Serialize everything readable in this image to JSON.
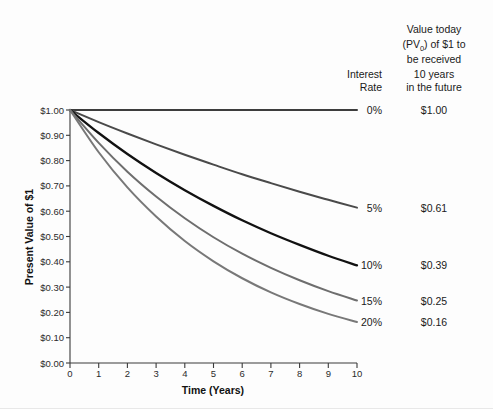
{
  "chart_data": {
    "type": "line",
    "title": "",
    "xlabel": "Time (Years)",
    "ylabel": "Present Value of $1",
    "xlim": [
      0,
      10
    ],
    "ylim": [
      0,
      1.0
    ],
    "grid": false,
    "legend_position": "right",
    "x": [
      0,
      1,
      2,
      3,
      4,
      5,
      6,
      7,
      8,
      9,
      10
    ],
    "xticklabels": [
      "0",
      "1",
      "2",
      "3",
      "4",
      "5",
      "6",
      "7",
      "8",
      "9",
      "10"
    ],
    "yticklabels": [
      "$0.00",
      "$0.10",
      "$0.20",
      "$0.30",
      "$0.40",
      "$0.50",
      "$0.60",
      "$0.70",
      "$0.80",
      "$0.90",
      "$1.00"
    ],
    "ytickvalues": [
      0,
      0.1,
      0.2,
      0.3,
      0.4,
      0.5,
      0.6,
      0.7,
      0.8,
      0.9,
      1.0
    ],
    "series": [
      {
        "name": "0%",
        "rate": 0.0,
        "color": "#3d3d3d",
        "width": 2.0,
        "final_value": "$1.00",
        "values": [
          1.0,
          1.0,
          1.0,
          1.0,
          1.0,
          1.0,
          1.0,
          1.0,
          1.0,
          1.0,
          1.0
        ]
      },
      {
        "name": "5%",
        "rate": 0.05,
        "color": "#4a4a4a",
        "width": 2.0,
        "final_value": "$0.61",
        "values": [
          1.0,
          0.952,
          0.907,
          0.864,
          0.823,
          0.784,
          0.746,
          0.711,
          0.677,
          0.645,
          0.614
        ]
      },
      {
        "name": "10%",
        "rate": 0.1,
        "color": "#111111",
        "width": 2.3,
        "final_value": "$0.39",
        "values": [
          1.0,
          0.909,
          0.826,
          0.751,
          0.683,
          0.621,
          0.564,
          0.513,
          0.467,
          0.424,
          0.386
        ]
      },
      {
        "name": "15%",
        "rate": 0.15,
        "color": "#6e6e6e",
        "width": 2.0,
        "final_value": "$0.25",
        "values": [
          1.0,
          0.87,
          0.756,
          0.658,
          0.572,
          0.497,
          0.432,
          0.376,
          0.327,
          0.284,
          0.247
        ]
      },
      {
        "name": "20%",
        "rate": 0.2,
        "color": "#787878",
        "width": 2.0,
        "final_value": "$0.16",
        "values": [
          1.0,
          0.833,
          0.694,
          0.579,
          0.482,
          0.402,
          0.335,
          0.279,
          0.233,
          0.194,
          0.162
        ]
      }
    ]
  },
  "legend": {
    "rate_header_line1": "Interest",
    "rate_header_line2": "Rate",
    "value_header_line1": "Value today",
    "value_header_line2_pre": "(PV",
    "value_header_line2_sub": "0",
    "value_header_line2_post": ") of $1 to",
    "value_header_line3": "be received",
    "value_header_line4": "10 years",
    "value_header_line5": "in the future"
  }
}
